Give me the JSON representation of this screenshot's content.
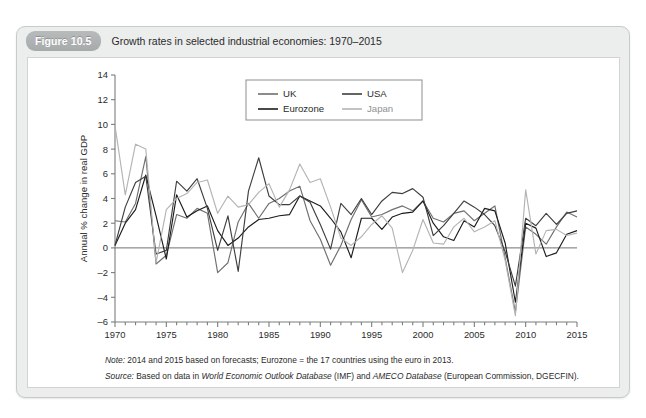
{
  "figure": {
    "tag": "Figure 10.5",
    "title": "Growth rates in selected industrial economies: 1970–2015"
  },
  "notes": {
    "note_label": "Note:",
    "note_text": " 2014 and 2015 based on forecasts; Eurozone = the 17 countries using the euro in 2013.",
    "source_label": "Source:",
    "source_pre": " Based on data in ",
    "source_ital1": "World Economic Outlook Database",
    "source_mid": " (IMF) and ",
    "source_ital2": "AMECO Database",
    "source_post": " (European Commission, DGECFIN)."
  },
  "colors": {
    "uk": "#6f6f6f",
    "eurozone": "#1c1c1c",
    "usa": "#3f3f3f",
    "japan": "#b4b4b4",
    "axis": "#7b7d7d",
    "zero_line": "#6f7171",
    "panel_bg": "#eceded",
    "tag_bg": "#adb0b0"
  },
  "chart_data": {
    "type": "line",
    "title": "Growth rates in selected industrial economies: 1970–2015",
    "xlabel": "",
    "ylabel": "Annual % change in real GDP",
    "xlim": [
      1970,
      2015
    ],
    "ylim": [
      -6,
      14
    ],
    "ytick_step": 2,
    "yticks": [
      -6,
      -4,
      -2,
      0,
      2,
      4,
      6,
      8,
      10,
      12,
      14
    ],
    "xticks": [
      1970,
      1975,
      1980,
      1985,
      1990,
      1995,
      2000,
      2005,
      2010,
      2015
    ],
    "xtick_labels": [
      "1970",
      "1975",
      "1980",
      "1985",
      "1990",
      "1995",
      "2000",
      "2005",
      "2010",
      "2015"
    ],
    "minor_xticks_every": 1,
    "grid": false,
    "zero_line": true,
    "legend_position": "top-center",
    "x": [
      1970,
      1971,
      1972,
      1973,
      1974,
      1975,
      1976,
      1977,
      1978,
      1979,
      1980,
      1981,
      1982,
      1983,
      1984,
      1985,
      1986,
      1987,
      1988,
      1989,
      1990,
      1991,
      1992,
      1993,
      1994,
      1995,
      1996,
      1997,
      1998,
      1999,
      2000,
      2001,
      2002,
      2003,
      2004,
      2005,
      2006,
      2007,
      2008,
      2009,
      2010,
      2011,
      2012,
      2013,
      2014,
      2015
    ],
    "series": [
      {
        "name": "UK",
        "color": "#6f6f6f",
        "values": [
          2.2,
          2.1,
          3.6,
          7.4,
          -1.3,
          -0.6,
          2.7,
          2.4,
          3.2,
          2.8,
          -2.0,
          -1.2,
          2.1,
          3.6,
          2.4,
          3.6,
          4.0,
          4.6,
          5.0,
          2.2,
          0.7,
          -1.4,
          0.2,
          2.3,
          3.9,
          2.5,
          2.7,
          3.1,
          3.4,
          3.0,
          3.8,
          2.4,
          2.1,
          2.8,
          3.0,
          2.2,
          2.8,
          3.4,
          -0.8,
          -5.2,
          1.7,
          1.1,
          0.3,
          1.7,
          2.9,
          2.5
        ]
      },
      {
        "name": "Eurozone",
        "color": "#1c1c1c",
        "values": [
          0.2,
          2.0,
          3.1,
          5.9,
          2.6,
          -0.9,
          4.3,
          2.5,
          3.0,
          3.4,
          1.4,
          0.2,
          0.8,
          1.7,
          2.3,
          2.4,
          2.6,
          2.7,
          4.2,
          3.8,
          3.4,
          2.4,
          1.3,
          -0.8,
          2.4,
          2.4,
          1.5,
          2.5,
          2.8,
          2.9,
          3.8,
          2.0,
          0.9,
          0.6,
          2.2,
          1.7,
          3.2,
          3.0,
          0.4,
          -4.4,
          2.0,
          1.6,
          -0.7,
          -0.4,
          1.1,
          1.4
        ]
      },
      {
        "name": "USA",
        "color": "#3f3f3f",
        "values": [
          0.2,
          3.3,
          5.3,
          5.8,
          -0.5,
          -0.2,
          5.4,
          4.6,
          5.6,
          3.2,
          -0.2,
          2.6,
          -1.9,
          4.6,
          7.3,
          4.2,
          3.5,
          3.5,
          4.2,
          3.7,
          1.9,
          -0.1,
          3.6,
          2.7,
          4.0,
          2.7,
          3.8,
          4.5,
          4.4,
          4.8,
          4.1,
          1.0,
          1.8,
          2.8,
          3.8,
          3.3,
          2.7,
          1.8,
          -0.3,
          -3.1,
          2.4,
          1.8,
          2.8,
          1.9,
          2.8,
          3.0
        ]
      },
      {
        "name": "Japan",
        "color": "#b4b4b4",
        "values": [
          9.9,
          4.3,
          8.4,
          8.0,
          -1.2,
          3.1,
          4.0,
          4.4,
          5.3,
          5.5,
          2.8,
          4.2,
          3.3,
          3.5,
          4.5,
          5.2,
          3.3,
          4.7,
          6.8,
          5.3,
          5.6,
          3.3,
          0.8,
          0.2,
          0.9,
          1.9,
          2.6,
          1.6,
          -2.0,
          -0.2,
          2.3,
          0.4,
          0.3,
          1.7,
          2.4,
          1.3,
          1.7,
          2.2,
          -1.0,
          -5.5,
          4.7,
          -0.5,
          1.4,
          1.5,
          1.0,
          1.2
        ]
      }
    ],
    "legend": [
      {
        "label": "UK",
        "color": "#6f6f6f"
      },
      {
        "label": "USA",
        "color": "#3f3f3f"
      },
      {
        "label": "Eurozone",
        "color": "#1c1c1c"
      },
      {
        "label": "Japan",
        "color": "#b4b4b4"
      }
    ]
  }
}
